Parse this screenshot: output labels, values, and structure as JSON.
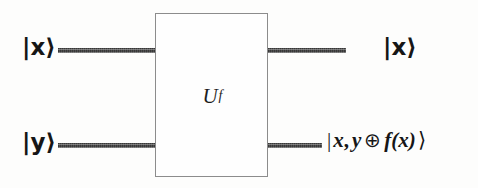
{
  "figure": {
    "background_color": "#fdfdfc",
    "ink_color": "#161616",
    "wire_color": "#6e6e6e",
    "box_border_color": "#8c8c8c"
  },
  "gate": {
    "label_base": "U",
    "label_subscript": "f",
    "label_full": "U_f"
  },
  "inputs": {
    "top": {
      "label": "|x⟩",
      "wire_name": "input-wire-top"
    },
    "bottom": {
      "label": "|y⟩",
      "wire_name": "input-wire-bottom"
    }
  },
  "outputs": {
    "top": {
      "label": "|x⟩",
      "wire_name": "output-wire-top"
    },
    "bottom": {
      "bar": "|",
      "var_x": "x",
      "comma": ",",
      "var_y": "y",
      "operator": "⊕",
      "function": "f(x)",
      "angle": "⟩",
      "label_full": "| x, y ⊕ f(x) ⟩",
      "wire_name": "output-wire-bottom"
    }
  }
}
